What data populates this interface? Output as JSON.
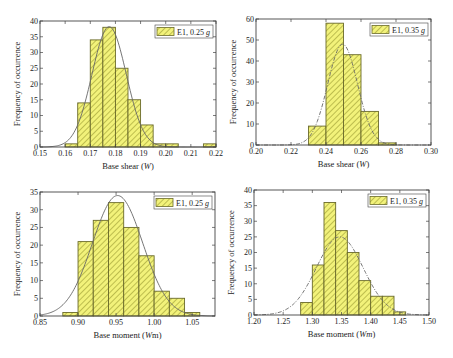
{
  "figure": {
    "colors": {
      "bar_fill": "#f2f27a",
      "hatch": "#a6a63a",
      "bar_edge": "#6a6a2a",
      "fit_line": "#666666",
      "axis": "#444444"
    }
  },
  "chart_data": [
    {
      "id": "top-left",
      "type": "bar",
      "title": "",
      "legend": "E1, 0.25 g",
      "legend_prefix": "E1, 0.25 ",
      "legend_italic": "g",
      "xlabel": "Base shear (W)",
      "xlabel_prefix": "Base shear (",
      "xlabel_italic": "W",
      "xlabel_suffix": ")",
      "ylabel": "Frequency of occurrence",
      "xlim": [
        0.15,
        0.22
      ],
      "ylim": [
        0,
        40
      ],
      "xticks": [
        "0.15",
        "0.16",
        "0.17",
        "0.18",
        "0.19",
        "0.20",
        "0.21",
        "0.22"
      ],
      "yticks": [
        "0",
        "5",
        "10",
        "15",
        "20",
        "25",
        "30",
        "35",
        "40"
      ],
      "bin_width": 0.005,
      "bins_left": [
        0.16,
        0.165,
        0.17,
        0.175,
        0.18,
        0.185,
        0.19,
        0.195,
        0.2,
        0.215
      ],
      "values": [
        1,
        14,
        34,
        38,
        25,
        15,
        7,
        1,
        1,
        1
      ],
      "fit": {
        "type": "normal",
        "style": "solid",
        "mean": 0.1775,
        "peak": 38.2,
        "sd": 0.0068
      },
      "plot_box": {
        "x": 40,
        "y": 21,
        "w": 176,
        "h": 126
      }
    },
    {
      "id": "top-right",
      "type": "bar",
      "title": "",
      "legend": "E1, 0.35 g",
      "legend_prefix": "E1, 0.35 ",
      "legend_italic": "g",
      "xlabel": "Base shear (W)",
      "xlabel_prefix": "Base shear (",
      "xlabel_italic": "W",
      "xlabel_suffix": ")",
      "ylabel": "Frequency of occurrence",
      "xlim": [
        0.2,
        0.3
      ],
      "ylim": [
        0,
        60
      ],
      "xticks": [
        "0.20",
        "0.22",
        "0.24",
        "0.26",
        "0.28",
        "0.30"
      ],
      "yticks": [
        "0",
        "10",
        "20",
        "30",
        "40",
        "50",
        "60"
      ],
      "bin_width": 0.01,
      "bins_left": [
        0.23,
        0.24,
        0.25,
        0.26,
        0.27
      ],
      "values": [
        9,
        58,
        43,
        16,
        1
      ],
      "fit": {
        "type": "normal",
        "style": "dashdot",
        "mean": 0.2495,
        "peak": 48,
        "sd": 0.0085
      },
      "plot_box": {
        "x": 256,
        "y": 19,
        "w": 175,
        "h": 126
      }
    },
    {
      "id": "bottom-left",
      "type": "bar",
      "title": "",
      "legend": "E1, 0.25 g",
      "legend_prefix": "E1, 0.25 ",
      "legend_italic": "g",
      "xlabel": "Base moment (Wm)",
      "xlabel_prefix": "Base moment (",
      "xlabel_italic": "W",
      "xlabel_suffix": "m)",
      "ylabel": "Frequency of occurrence",
      "xlim": [
        0.85,
        1.08
      ],
      "ylim": [
        0,
        35
      ],
      "xticks": [
        "0.85",
        "0.90",
        "0.95",
        "1.00",
        "1.05"
      ],
      "xtick_values": [
        0.85,
        0.9,
        0.95,
        1.0,
        1.05
      ],
      "yticks": [
        "0",
        "5",
        "10",
        "15",
        "20",
        "25",
        "30",
        "35"
      ],
      "bin_width": 0.02,
      "bins_left": [
        0.88,
        0.9,
        0.92,
        0.94,
        0.96,
        0.98,
        1.0,
        1.02,
        1.04
      ],
      "values": [
        1,
        21,
        27,
        32,
        25,
        17,
        7,
        5,
        1
      ],
      "fit": {
        "type": "normal",
        "style": "solid",
        "mean": 0.952,
        "peak": 34,
        "sd": 0.033
      },
      "plot_box": {
        "x": 40,
        "y": 192,
        "w": 175,
        "h": 124
      }
    },
    {
      "id": "bottom-right",
      "type": "bar",
      "title": "",
      "legend": "E1, 0.35 g",
      "legend_prefix": "E1, 0.35 ",
      "legend_italic": "g",
      "xlabel": "Base moment (Wm)",
      "xlabel_prefix": "Base moment (",
      "xlabel_italic": "Wm",
      "xlabel_suffix": ")",
      "ylabel": "Frequency of occurrence",
      "xlim": [
        1.2,
        1.5
      ],
      "ylim": [
        0,
        40
      ],
      "xticks": [
        "1.20",
        "1.25",
        "1.30",
        "1.35",
        "1.40",
        "1.45",
        "1.50"
      ],
      "yticks": [
        "0",
        "5",
        "10",
        "15",
        "20",
        "25",
        "30",
        "35",
        "40"
      ],
      "bin_width": 0.02,
      "bins_left": [
        1.28,
        1.3,
        1.32,
        1.34,
        1.36,
        1.38,
        1.4,
        1.42,
        1.44
      ],
      "values": [
        4,
        16,
        36,
        27,
        20,
        11,
        6,
        6,
        1
      ],
      "fit": {
        "type": "normal",
        "style": "dashdot",
        "mean": 1.347,
        "peak": 25,
        "sd": 0.04
      },
      "plot_box": {
        "x": 254,
        "y": 190,
        "w": 175,
        "h": 125
      }
    }
  ]
}
